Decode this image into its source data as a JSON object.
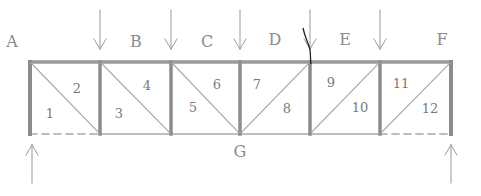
{
  "diagram": {
    "type": "truss-load-diagram",
    "style": "hand-drawn pencil",
    "colors": {
      "chord": "#9a9a9a",
      "post": "#8c8c8c",
      "diagonal": "#a8a8a8",
      "arrow": "#9a9a9a",
      "text": "#8a8a8a",
      "ink_mark": "#222222"
    },
    "space_labels": [
      {
        "id": "A",
        "text": "A",
        "x": 12,
        "y": 42
      },
      {
        "id": "B",
        "text": "B",
        "x": 136,
        "y": 42
      },
      {
        "id": "C",
        "text": "C",
        "x": 207,
        "y": 42
      },
      {
        "id": "D",
        "text": "D",
        "x": 275,
        "y": 40
      },
      {
        "id": "E",
        "text": "E",
        "x": 345,
        "y": 40
      },
      {
        "id": "F",
        "text": "F",
        "x": 442,
        "y": 40
      },
      {
        "id": "G",
        "text": "G",
        "x": 240,
        "y": 152
      }
    ],
    "panel_labels": [
      {
        "text": "1",
        "x": 50,
        "y": 113
      },
      {
        "text": "2",
        "x": 77,
        "y": 88
      },
      {
        "text": "3",
        "x": 119,
        "y": 113
      },
      {
        "text": "4",
        "x": 147,
        "y": 85
      },
      {
        "text": "5",
        "x": 193,
        "y": 107
      },
      {
        "text": "6",
        "x": 217,
        "y": 84
      },
      {
        "text": "7",
        "x": 257,
        "y": 84
      },
      {
        "text": "8",
        "x": 287,
        "y": 108
      },
      {
        "text": "9",
        "x": 331,
        "y": 82
      },
      {
        "text": "10",
        "x": 360,
        "y": 107
      },
      {
        "text": "11",
        "x": 401,
        "y": 83
      },
      {
        "text": "12",
        "x": 430,
        "y": 108
      }
    ],
    "geometry": {
      "top_y": 62,
      "bottom_y": 134,
      "posts_x": [
        30,
        100,
        171,
        240,
        310,
        380,
        451
      ]
    },
    "diagonals": [
      {
        "panel": 1,
        "direction": "down-right"
      },
      {
        "panel": 2,
        "direction": "down-right"
      },
      {
        "panel": 3,
        "direction": "down-right"
      },
      {
        "panel": 4,
        "direction": "up-right"
      },
      {
        "panel": 5,
        "direction": "up-right"
      },
      {
        "panel": 6,
        "direction": "up-right"
      }
    ],
    "bottom_chord_dashed_panels": [
      1,
      6
    ],
    "loads": [
      {
        "x": 100,
        "direction": "down"
      },
      {
        "x": 171,
        "direction": "down"
      },
      {
        "x": 240,
        "direction": "down"
      },
      {
        "x": 310,
        "direction": "down"
      },
      {
        "x": 380,
        "direction": "down"
      }
    ],
    "reactions": [
      {
        "x": 32,
        "direction": "up"
      },
      {
        "x": 451,
        "direction": "up"
      }
    ]
  }
}
